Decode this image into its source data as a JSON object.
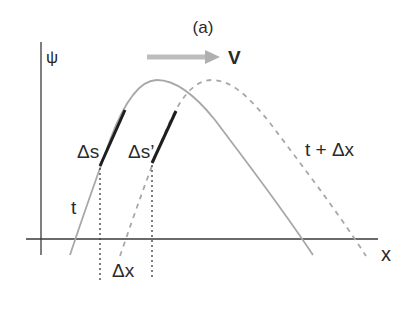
{
  "figure": {
    "panel_label": "(a)",
    "y_axis_label": "ψ",
    "x_axis_label": "x",
    "velocity_label": "V",
    "curve_t_label": "t",
    "curve_t_dx_label": "t + Δx",
    "segment_label_1": "Δs",
    "segment_label_2": "Δs’",
    "shift_label": "Δx"
  },
  "colors": {
    "axis": "#3a3a3a",
    "curve_solid": "#a8a8a8",
    "curve_dashed": "#a8a8a8",
    "segment": "#1e1e1e",
    "arrow": "#b5b5b5",
    "text": "#2a2a2a"
  }
}
